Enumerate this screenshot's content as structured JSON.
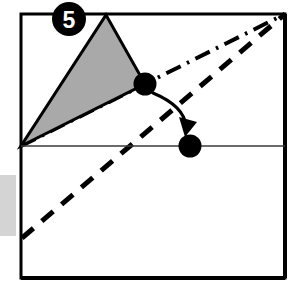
{
  "figure": {
    "label_number": "5",
    "canvas": {
      "width": 293,
      "height": 286,
      "background": "#ffffff"
    }
  },
  "colors": {
    "stroke": "#000000",
    "triangle_fill": "#a9a9a9",
    "triangle_stroke": "#000000",
    "thin_line": "#3a3a3a",
    "side_bar": "#d4d4d4",
    "badge_fill": "#000000",
    "badge_text": "#ffffff"
  },
  "badge": {
    "name": "step-number-badge",
    "value": "5",
    "cx": 69,
    "cy": 19,
    "r": 17
  },
  "frame": {
    "name": "outer-box",
    "x": 21,
    "y": 14,
    "width": 264,
    "height": 264,
    "stroke_width": 3
  },
  "side_bar": {
    "name": "left-gray-bar",
    "x": 0,
    "y": 175,
    "width": 16,
    "height": 61
  },
  "shapes": {
    "triangle": {
      "name": "shaded-triangle",
      "points": "106,15 145,84 21,146",
      "fill": "#a9a9a9",
      "stroke_width": 3,
      "vertices": [
        {
          "label": "apex",
          "x": 106,
          "y": 15
        },
        {
          "label": "right",
          "x": 145,
          "y": 84
        },
        {
          "label": "left-pivot",
          "x": 21,
          "y": 146
        }
      ]
    },
    "horizontal_line": {
      "name": "horizontal-baseline",
      "x1": 21,
      "y1": 146,
      "x2": 285,
      "y2": 146,
      "stroke_width": 1.6
    },
    "dash_dot_line": {
      "name": "dash-dot-diagonal",
      "x1": 21,
      "y1": 146,
      "x2": 285,
      "y2": 14,
      "stroke_width": 4,
      "dash_pattern": "16 7 2.5 7"
    },
    "dashed_line": {
      "name": "dashed-diagonal",
      "x1": 22,
      "y1": 238,
      "x2": 285,
      "y2": 14,
      "stroke_width": 5,
      "dash_pattern": "15 11"
    }
  },
  "markers": [
    {
      "name": "source-dot",
      "cx": 145,
      "cy": 84,
      "r": 11.5,
      "fill": "#000000"
    },
    {
      "name": "target-dot",
      "cx": 190,
      "cy": 146,
      "r": 11.5,
      "fill": "#000000"
    }
  ],
  "arrow": {
    "name": "motion-arrow",
    "path": "M 153 93 Q 183 107 186 127",
    "stroke_width": 3,
    "arrowhead": "181,118 196,124 185,136",
    "from": "source-dot",
    "to": "target-dot"
  }
}
